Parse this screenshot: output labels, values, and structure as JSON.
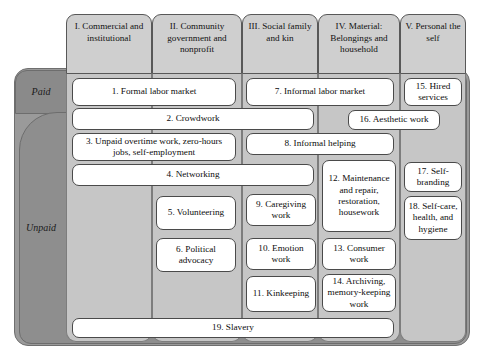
{
  "figure": {
    "bands": [
      {
        "id": "paid",
        "label": "Paid"
      },
      {
        "id": "unpaid",
        "label": "Unpaid"
      }
    ],
    "columns": [
      {
        "id": "col-1",
        "label": "I. Commercial and institutional"
      },
      {
        "id": "col-2",
        "label": "II. Community government and nonprofit"
      },
      {
        "id": "col-3",
        "label": "III. Social family and kin"
      },
      {
        "id": "col-4",
        "label": "IV. Material: Belongings and household"
      },
      {
        "id": "col-5",
        "label": "V. Personal the self"
      }
    ],
    "items": [
      {
        "n": 1,
        "label": "1. Formal labor market"
      },
      {
        "n": 2,
        "label": "2. Crowdwork"
      },
      {
        "n": 3,
        "label": "3. Unpaid overtime work, zero-hours jobs, self-employment"
      },
      {
        "n": 4,
        "label": "4. Networking"
      },
      {
        "n": 5,
        "label": "5. Volunteering"
      },
      {
        "n": 6,
        "label": "6. Political advocacy"
      },
      {
        "n": 7,
        "label": "7. Informal labor market"
      },
      {
        "n": 8,
        "label": "8. Informal helping"
      },
      {
        "n": 9,
        "label": "9. Caregiving work"
      },
      {
        "n": 10,
        "label": "10. Emotion work"
      },
      {
        "n": 11,
        "label": "11. Kinkeeping"
      },
      {
        "n": 12,
        "label": "12. Maintenance and repair, restoration, housework"
      },
      {
        "n": 13,
        "label": "13. Consumer work"
      },
      {
        "n": 14,
        "label": "14. Archiving, memory-keeping work"
      },
      {
        "n": 15,
        "label": "15. Hired services"
      },
      {
        "n": 16,
        "label": "16. Aesthetic work"
      },
      {
        "n": 17,
        "label": "17. Self-branding"
      },
      {
        "n": 18,
        "label": "18. Self-care, health, and hygiene"
      },
      {
        "n": 19,
        "label": "19. Slavery"
      }
    ],
    "colors": {
      "outer_frame": "#9a9a9a",
      "paid_band": "#8a8a8a",
      "unpaid_band": "#8e8e8e",
      "column_header": "#cfcfcf",
      "column_body": "#c6c6c6",
      "item_box": "#ffffff",
      "border": "#4a4a4a"
    }
  }
}
